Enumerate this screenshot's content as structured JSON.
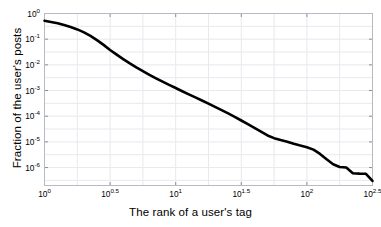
{
  "chart_data": {
    "type": "line",
    "title": "",
    "subtitle": "",
    "xlabel": "The rank of a user's tag",
    "ylabel": "Fraction of the user's posts",
    "xscale": "log",
    "yscale": "log",
    "xlim": [
      1,
      316.227766
    ],
    "ylim": [
      2e-07,
      1.0
    ],
    "grid": true,
    "legend": null,
    "line_color": "#000000",
    "line_width": 2.6,
    "background_color": "#ffffff",
    "grid_color": "#e8e8ee",
    "axis_color": "#b9b9c4",
    "xticks": [
      1,
      3.1622777,
      10,
      31.622777,
      100,
      316.227766
    ],
    "xtick_labels": [
      "10",
      "10",
      "10",
      "10",
      "10",
      "10"
    ],
    "xtick_exponents": [
      "0",
      "0.5",
      "1",
      "1.5",
      "2",
      "2.5"
    ],
    "yticks": [
      1,
      0.1,
      0.01,
      0.001,
      0.0001,
      1e-05,
      1e-06
    ],
    "ytick_labels": [
      "10",
      "10",
      "10",
      "10",
      "10",
      "10",
      "10"
    ],
    "ytick_exponents": [
      "0",
      "-1",
      "-2",
      "-3",
      "-4",
      "-5",
      "-6"
    ],
    "x": [
      1.0,
      1.12,
      1.26,
      1.41,
      1.58,
      1.78,
      2.0,
      2.24,
      2.51,
      2.82,
      3.16,
      3.55,
      3.98,
      4.47,
      5.01,
      5.62,
      6.31,
      7.08,
      7.94,
      8.91,
      10.0,
      11.22,
      12.59,
      14.13,
      15.85,
      17.78,
      19.95,
      22.39,
      25.12,
      28.18,
      31.62,
      35.48,
      39.81,
      44.67,
      50.12,
      56.23,
      63.1,
      70.79,
      79.43,
      89.13,
      100.0,
      112.2,
      125.9,
      141.3,
      158.5,
      177.8,
      199.5,
      223.9,
      251.2,
      281.8,
      316.2
    ],
    "y": [
      0.52,
      0.47,
      0.42,
      0.36,
      0.3,
      0.24,
      0.185,
      0.135,
      0.092,
      0.06,
      0.038,
      0.025,
      0.0168,
      0.0114,
      0.008,
      0.0057,
      0.0041,
      0.003,
      0.00222,
      0.00166,
      0.00125,
      0.00094,
      0.00071,
      0.00054,
      0.00041,
      0.00031,
      0.00023,
      0.000172,
      0.000128,
      9.4e-05,
      6.8e-05,
      4.9e-05,
      3.5e-05,
      2.5e-05,
      1.78e-05,
      1.4e-05,
      1.18e-05,
      1.02e-05,
      8.5e-06,
      7.2e-06,
      6.2e-06,
      5e-06,
      3.4e-06,
      2.1e-06,
      1.35e-06,
      1.05e-06,
      1e-06,
      6e-07,
      5.8e-07,
      5.7e-07,
      3e-07
    ]
  }
}
